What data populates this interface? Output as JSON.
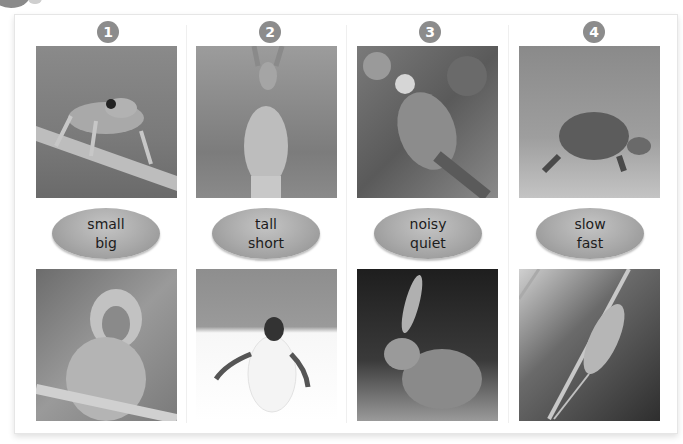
{
  "columns": [
    {
      "number": "1",
      "adjectives": [
        "small",
        "big"
      ],
      "top_image": "frog",
      "bottom_image": "monkey"
    },
    {
      "number": "2",
      "adjectives": [
        "tall",
        "short"
      ],
      "top_image": "kangaroo",
      "bottom_image": "penguin"
    },
    {
      "number": "3",
      "adjectives": [
        "noisy",
        "quiet"
      ],
      "top_image": "parrot",
      "bottom_image": "rabbit"
    },
    {
      "number": "4",
      "adjectives": [
        "slow",
        "fast"
      ],
      "top_image": "tortoise",
      "bottom_image": "mouse"
    }
  ],
  "colors": {
    "badge": "#8c8c8c",
    "oval": "#a8a8a8",
    "text": "#1c1c1c"
  }
}
